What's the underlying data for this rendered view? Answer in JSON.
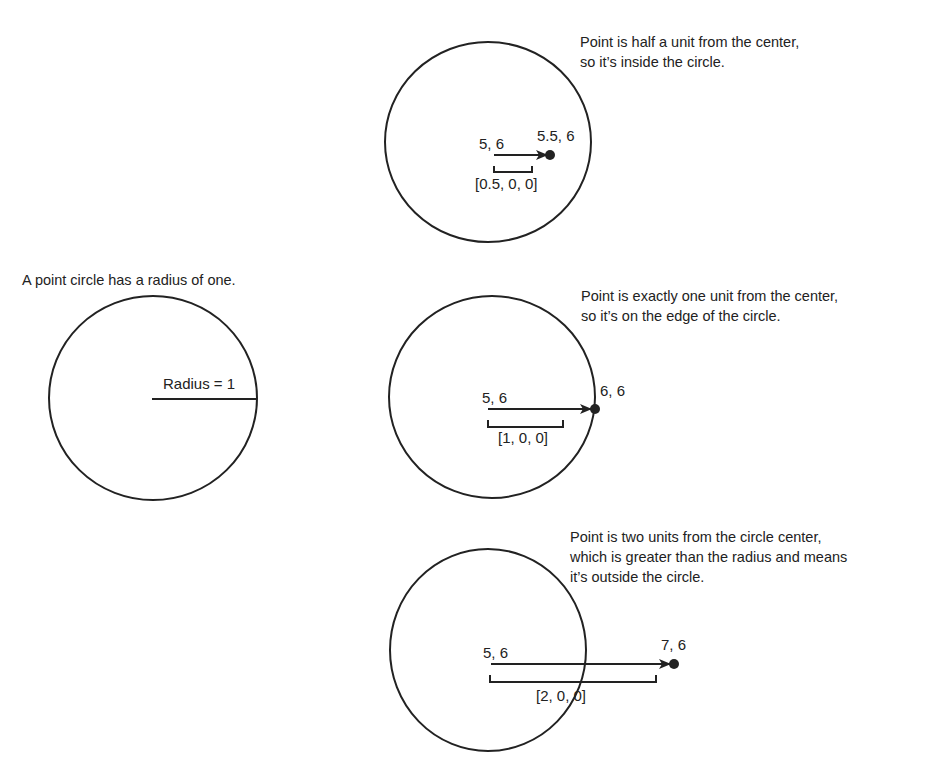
{
  "colors": {
    "stroke": "#222222",
    "text": "#222222",
    "background": "#ffffff"
  },
  "reference": {
    "caption": "A point circle has a radius of one.",
    "radius_label": "Radius = 1"
  },
  "panels": [
    {
      "caption": "Point is half a unit from the center,\nso it’s inside the circle.",
      "center_label": "5, 6",
      "point_label": "5.5, 6",
      "vector_label": "[0.5, 0, 0]"
    },
    {
      "caption": "Point is exactly one unit from the center,\nso it’s on the edge of the circle.",
      "center_label": "5, 6",
      "point_label": "6, 6",
      "vector_label": "[1, 0, 0]"
    },
    {
      "caption": "Point is two units from the circle center,\nwhich is greater than the radius and means\nit’s outside the circle.",
      "center_label": "5, 6",
      "point_label": "7, 6",
      "vector_label": "[2, 0, 0]"
    }
  ]
}
